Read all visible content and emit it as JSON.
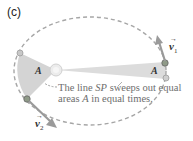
{
  "panel": {
    "label": "(c)"
  },
  "caption": {
    "line1_prefix": "The line ",
    "line1_symbol": "SP",
    "line1_suffix": " sweeps out equal",
    "line2_prefix": "areas ",
    "line2_symbol": "A",
    "line2_suffix": " in equal times."
  },
  "labels": {
    "area_left": "A",
    "area_right": "A",
    "velocity_1": "v",
    "velocity_1_sub": "1",
    "velocity_2": "v",
    "velocity_2_sub": "2",
    "vector_arrow": "→"
  },
  "colors": {
    "orbit": "#a9a9a9",
    "wedge_fill": "#d6d6d6",
    "sun": "#e8e8e8",
    "planet": "#8c9a86",
    "arrow": "#9a9a9a",
    "text": "#6e6e6e"
  }
}
